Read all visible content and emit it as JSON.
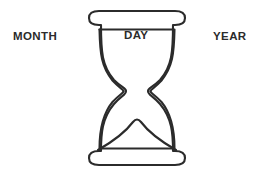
{
  "canvas": {
    "width": 270,
    "height": 176,
    "background_color": "#ffffff"
  },
  "diagram": {
    "type": "hourglass-timeline",
    "icon_name": "hourglass-icon",
    "stroke_color": "#2b2b2b",
    "fill_color": "#ffffff",
    "stroke_width": 2
  },
  "labels": {
    "left": "MONTH",
    "center": "DAY",
    "right": "YEAR"
  },
  "shape_parts": [
    "top-cap",
    "upper-bulb",
    "neck",
    "lower-bulb",
    "sand-mound",
    "bottom-cap"
  ]
}
